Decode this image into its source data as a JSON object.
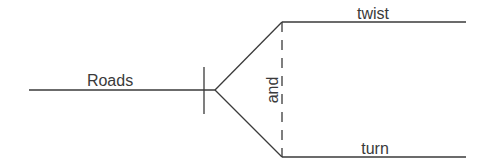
{
  "diagram": {
    "type": "sentence-diagram",
    "subject": "Roads",
    "conjunction": "and",
    "predicates": [
      "twist",
      "turn"
    ],
    "colors": {
      "line": "#3a3a3a",
      "text": "#3a3a3a",
      "background": "#ffffff"
    }
  }
}
